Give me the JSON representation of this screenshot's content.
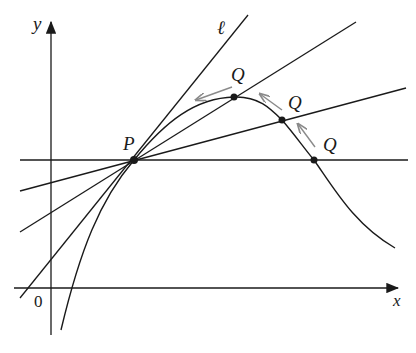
{
  "diagram": {
    "axes": {
      "x_label": "x",
      "y_label": "y",
      "origin_label": "0"
    },
    "points": {
      "P": {
        "label": "P",
        "x": 134,
        "y": 160
      },
      "Q1": {
        "label": "Q",
        "x": 234,
        "y": 97
      },
      "Q2": {
        "label": "Q",
        "x": 282,
        "y": 120
      },
      "Q3": {
        "label": "Q",
        "x": 314,
        "y": 160
      }
    },
    "tangent_label": "ℓ",
    "colors": {
      "ink": "#1a1a1a",
      "arrow": "#8a8a8a"
    }
  }
}
